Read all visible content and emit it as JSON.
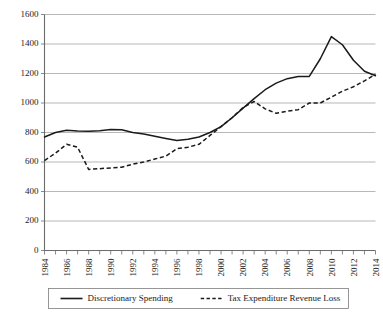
{
  "chart_data": {
    "type": "line",
    "title": "",
    "xlabel": "",
    "ylabel": "",
    "xlim": [
      1984,
      2014
    ],
    "ylim": [
      0,
      1600
    ],
    "yticks": [
      0,
      200,
      400,
      600,
      800,
      1000,
      1200,
      1400,
      1600
    ],
    "xticks": [
      1984,
      1985,
      1986,
      1987,
      1988,
      1989,
      1990,
      1991,
      1992,
      1993,
      1994,
      1995,
      1996,
      1997,
      1998,
      1999,
      2000,
      2001,
      2002,
      2003,
      2004,
      2005,
      2006,
      2007,
      2008,
      2009,
      2010,
      2011,
      2012,
      2013,
      2014
    ],
    "xtick_labels": [
      "1984",
      "",
      "1986",
      "",
      "1988",
      "",
      "1990",
      "",
      "1992",
      "",
      "1994",
      "",
      "1996",
      "",
      "1998",
      "",
      "2000",
      "",
      "2002",
      "",
      "2004",
      "",
      "2006",
      "",
      "2008",
      "",
      "2010",
      "",
      "2012",
      "",
      "2014"
    ],
    "grid": true,
    "grid_axis": "y",
    "legend_position": "bottom",
    "x": [
      1984,
      1985,
      1986,
      1987,
      1988,
      1989,
      1990,
      1991,
      1992,
      1993,
      1994,
      1995,
      1996,
      1997,
      1998,
      1999,
      2000,
      2001,
      2002,
      2003,
      2004,
      2005,
      2006,
      2007,
      2008,
      2009,
      2010,
      2011,
      2012,
      2013,
      2014
    ],
    "series": [
      {
        "name": "Discretionary Spending",
        "style": "solid",
        "color": "#1a1a1a",
        "values": [
          770,
          800,
          815,
          810,
          808,
          812,
          820,
          818,
          800,
          790,
          775,
          760,
          745,
          755,
          770,
          800,
          840,
          900,
          965,
          1030,
          1090,
          1135,
          1165,
          1180,
          1180,
          1300,
          1450,
          1395,
          1290,
          1215,
          1185
        ]
      },
      {
        "name": "Tax Expenditure Revenue Loss",
        "style": "dashed",
        "color": "#1a1a1a",
        "values": [
          610,
          660,
          720,
          700,
          550,
          555,
          560,
          565,
          585,
          600,
          620,
          640,
          690,
          700,
          720,
          780,
          840,
          900,
          970,
          1010,
          960,
          930,
          945,
          955,
          1000,
          1000,
          1040,
          1080,
          1110,
          1150,
          1195
        ]
      }
    ]
  },
  "legend": {
    "entries": [
      {
        "label": "Discretionary Spending",
        "style": "solid"
      },
      {
        "label": "Tax Expenditure Revenue Loss",
        "style": "dashed"
      }
    ]
  },
  "title_fragment": {
    "text": ""
  }
}
